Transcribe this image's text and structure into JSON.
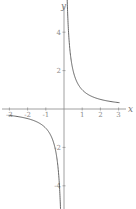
{
  "chart_data": {
    "type": "line",
    "title": "",
    "function": "y = 1/x",
    "xlabel": "x",
    "ylabel": "y",
    "xlim": [
      -3.4,
      3.6
    ],
    "ylim": [
      -5.5,
      5.7
    ],
    "grid": false,
    "legend": null,
    "x_ticks": [
      -3,
      -2,
      -1,
      1,
      2,
      3
    ],
    "x_tick_labels": [
      "-3",
      "-2",
      "-1",
      "1",
      "2",
      "3"
    ],
    "y_ticks": [
      4,
      2,
      -2,
      -4
    ],
    "y_tick_labels": [
      "4",
      "2",
      "-2",
      "-4"
    ],
    "series": [
      {
        "name": "right branch",
        "x": [
          0.18,
          0.2,
          0.25,
          0.33,
          0.5,
          0.75,
          1,
          1.5,
          2,
          2.5,
          3
        ],
        "values": [
          5.56,
          5.0,
          4.0,
          3.03,
          2.0,
          1.33,
          1.0,
          0.67,
          0.5,
          0.4,
          0.33
        ]
      },
      {
        "name": "left branch",
        "x": [
          -3,
          -2.5,
          -2,
          -1.5,
          -1,
          -0.75,
          -0.5,
          -0.33,
          -0.25,
          -0.2,
          -0.18
        ],
        "values": [
          -0.33,
          -0.4,
          -0.5,
          -0.67,
          -1.0,
          -1.33,
          -2.0,
          -3.03,
          -4.0,
          -5.0,
          -5.56
        ]
      }
    ],
    "colors": {
      "curve": "#555555",
      "axis": "#888888",
      "tick_label": "#8a8a8a"
    }
  }
}
